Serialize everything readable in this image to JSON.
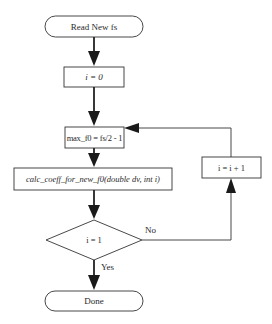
{
  "diagram": {
    "type": "flowchart",
    "nodes": {
      "start": {
        "shape": "terminal",
        "label": "Read New fs"
      },
      "init": {
        "shape": "process",
        "label": "i = 0"
      },
      "max_f0": {
        "shape": "process",
        "label": "max_f0 = fs/2 - 1"
      },
      "calc": {
        "shape": "process",
        "label": "calc_coeff_for_new_f0(double dv, int i)"
      },
      "decision": {
        "shape": "decision",
        "label": "i = 1"
      },
      "increment": {
        "shape": "process",
        "label": "i = i + 1"
      },
      "done": {
        "shape": "terminal",
        "label": "Done"
      }
    },
    "edges": {
      "no_label": "No",
      "yes_label": "Yes"
    },
    "colors": {
      "stroke": "#333333",
      "arrow_fill": "#1a1a1a",
      "background": "#ffffff"
    }
  }
}
